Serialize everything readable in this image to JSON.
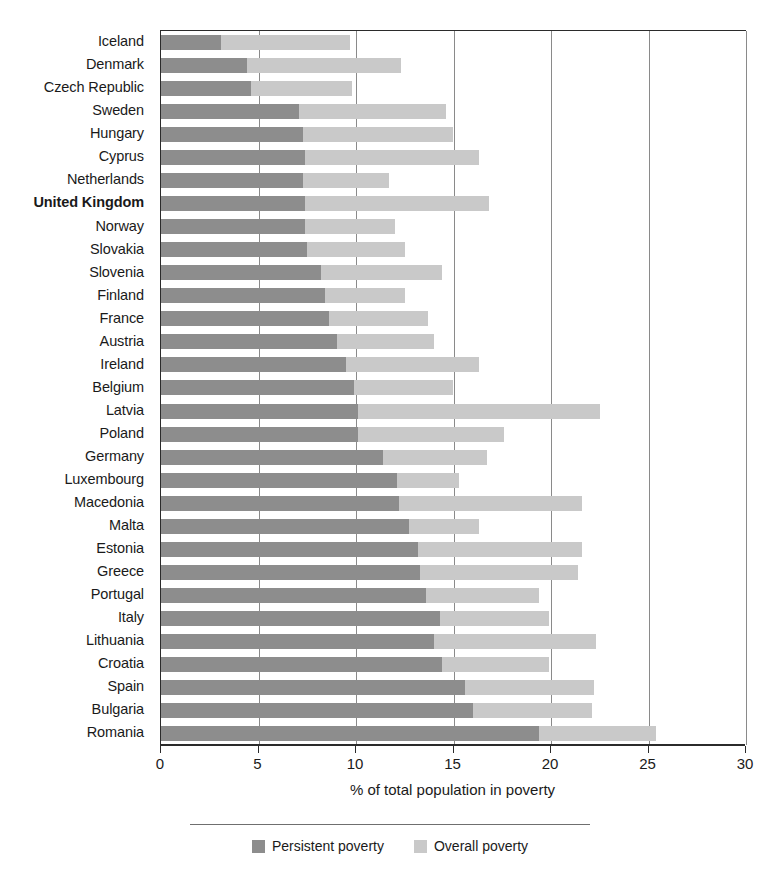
{
  "chart_data": {
    "type": "bar",
    "orientation": "horizontal",
    "stacked": false,
    "title": "",
    "subtitle": "",
    "xlabel": "% of total population in poverty",
    "ylabel": "",
    "xlim": [
      0,
      30
    ],
    "xticks": [
      0,
      5,
      10,
      15,
      20,
      25,
      30
    ],
    "xtick_labels": [
      "0",
      "5",
      "10",
      "15",
      "20",
      "25",
      "30"
    ],
    "grid": "vertical",
    "legend_position": "bottom-center",
    "highlight_category": "United Kingdom",
    "colors": {
      "persistent": "#8d8d8d",
      "overall": "#c9c9c9",
      "axis": "#2b2b2b",
      "gridline": "#8a8a8a"
    },
    "categories": [
      "Iceland",
      "Denmark",
      "Czech Republic",
      "Sweden",
      "Hungary",
      "Cyprus",
      "Netherlands",
      "United Kingdom",
      "Norway",
      "Slovakia",
      "Slovenia",
      "Finland",
      "France",
      "Austria",
      "Ireland",
      "Belgium",
      "Latvia",
      "Poland",
      "Germany",
      "Luxembourg",
      "Macedonia",
      "Malta",
      "Estonia",
      "Greece",
      "Portugal",
      "Italy",
      "Lithuania",
      "Croatia",
      "Spain",
      "Bulgaria",
      "Romania"
    ],
    "series": [
      {
        "name": "Persistent poverty",
        "color": "#8d8d8d",
        "values": [
          3.1,
          4.4,
          4.6,
          7.1,
          7.3,
          7.4,
          7.3,
          7.4,
          7.4,
          7.5,
          8.2,
          8.4,
          8.6,
          9.0,
          9.5,
          9.9,
          10.1,
          10.1,
          11.4,
          12.1,
          12.2,
          12.7,
          13.2,
          13.3,
          13.6,
          14.3,
          14.0,
          14.4,
          15.6,
          16.0,
          19.4
        ]
      },
      {
        "name": "Overall poverty",
        "color": "#c9c9c9",
        "values": [
          9.7,
          12.3,
          9.8,
          14.6,
          15.0,
          16.3,
          11.7,
          16.8,
          12.0,
          12.5,
          14.4,
          12.5,
          13.7,
          14.0,
          16.3,
          15.0,
          22.5,
          17.6,
          16.7,
          15.3,
          21.6,
          16.3,
          21.6,
          21.4,
          19.4,
          19.9,
          22.3,
          19.9,
          22.2,
          22.1,
          25.4
        ]
      }
    ]
  },
  "legend": {
    "items": [
      {
        "label": "Persistent poverty",
        "color": "#8d8d8d"
      },
      {
        "label": "Overall poverty",
        "color": "#c9c9c9"
      }
    ]
  }
}
